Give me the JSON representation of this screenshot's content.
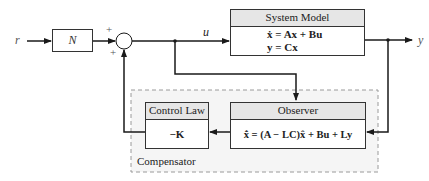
{
  "diagram": {
    "signals": {
      "input": "r",
      "control": "u",
      "output": "y"
    },
    "gain_block": {
      "label": "N"
    },
    "summing_junction": {
      "signs": [
        "+",
        "+"
      ]
    },
    "system_model": {
      "header": "System Model",
      "eq1": "ẋ = Ax + Bu",
      "eq2": "y = Cx"
    },
    "compensator": {
      "label": "Compensator",
      "control_law": {
        "header": "Control Law",
        "body": "−K"
      },
      "observer": {
        "header": "Observer",
        "body": "x̂̇ = (A − LC)x̂ + Bu + Ly"
      }
    },
    "colors": {
      "line": "#1a1a1a",
      "header_fill": "#e6e6e6",
      "dashed_border": "#999999",
      "compensator_fill": "#f4f4f4"
    }
  }
}
